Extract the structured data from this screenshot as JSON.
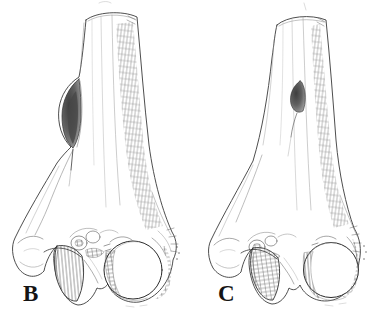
{
  "figure": {
    "alt": "Pen-and-ink scientific illustration of the distal ends of two long bones in anterior view, labelled B and C; each shaft bears a dark oval opening on its medial side",
    "panels": [
      {
        "label": "B"
      },
      {
        "label": "C"
      }
    ],
    "colors": {
      "paper": "#ffffff",
      "ink": "#2a2a2a",
      "shading": "#6a6a6a",
      "lesion_dark": "#3e3e3e"
    }
  }
}
